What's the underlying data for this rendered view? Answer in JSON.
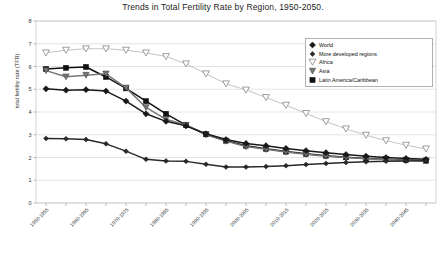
{
  "chart_data": {
    "type": "line",
    "title": "Trends in Total Fertility Rate by Region, 1950-2050.",
    "xlabel": "",
    "ylabel": "total fertility rate (TFR)",
    "ylim": [
      0,
      8
    ],
    "yticks": [
      0,
      1,
      2,
      3,
      4,
      5,
      6,
      7,
      8
    ],
    "grid": true,
    "legend_position": "upper-right",
    "categories": [
      "1950-1955",
      "1955-1960",
      "1960-1965",
      "1965-1970",
      "1970-1975",
      "1975-1980",
      "1980-1985",
      "1985-1990",
      "1990-1995",
      "1995-2000",
      "2000-2005",
      "2005-2010",
      "2010-2015",
      "2015-2020",
      "2020-2025",
      "2025-2030",
      "2030-2035",
      "2035-2040",
      "2040-2045",
      "2045-2050"
    ],
    "tick_labels": [
      "1950-1955",
      "",
      "1960-1965",
      "",
      "1970-1975",
      "",
      "1980-1985",
      "",
      "1990-1995",
      "",
      "2000-2005",
      "",
      "2010-2015",
      "",
      "2020-2025",
      "",
      "2030-2035",
      "",
      "2040-2045",
      ""
    ],
    "series": [
      {
        "name": "World",
        "marker": "filled-diamond",
        "color": "#1a1a1a",
        "values": [
          5.02,
          4.96,
          4.98,
          4.92,
          4.48,
          3.92,
          3.59,
          3.39,
          3.04,
          2.79,
          2.62,
          2.52,
          2.4,
          2.3,
          2.21,
          2.13,
          2.06,
          2.0,
          1.96,
          1.92
        ]
      },
      {
        "name": "More developed regions",
        "marker": "filled-diamond-small",
        "color": "#2a2a2a",
        "values": [
          2.84,
          2.82,
          2.79,
          2.6,
          2.28,
          1.92,
          1.85,
          1.83,
          1.7,
          1.58,
          1.58,
          1.6,
          1.64,
          1.69,
          1.74,
          1.78,
          1.81,
          1.84,
          1.85,
          1.86
        ]
      },
      {
        "name": "Africa",
        "marker": "open-triangle-down",
        "color": "#9e9e9e",
        "values": [
          6.6,
          6.72,
          6.78,
          6.78,
          6.72,
          6.6,
          6.44,
          6.12,
          5.68,
          5.24,
          4.97,
          4.64,
          4.3,
          3.94,
          3.58,
          3.26,
          2.98,
          2.74,
          2.54,
          2.38
        ]
      },
      {
        "name": "Asia",
        "marker": "filled-triangle-down",
        "color": "#777777",
        "values": [
          5.82,
          5.55,
          5.62,
          5.68,
          5.06,
          4.2,
          3.68,
          3.42,
          3.0,
          2.72,
          2.48,
          2.36,
          2.24,
          2.14,
          2.06,
          2.0,
          1.95,
          1.91,
          1.88,
          1.86
        ]
      },
      {
        "name": "Latin America/Caribbean",
        "marker": "filled-square",
        "color": "#111111",
        "values": [
          5.89,
          5.94,
          5.98,
          5.54,
          5.04,
          4.48,
          3.92,
          3.42,
          3.02,
          2.74,
          2.52,
          2.38,
          2.26,
          2.16,
          2.08,
          2.01,
          1.96,
          1.92,
          1.89,
          1.86
        ]
      }
    ]
  },
  "legend": {
    "items": [
      {
        "label": "World"
      },
      {
        "label": "More developed regions"
      },
      {
        "label": "Africa"
      },
      {
        "label": "Asia"
      },
      {
        "label": "Latin America/Caribbean"
      }
    ]
  }
}
